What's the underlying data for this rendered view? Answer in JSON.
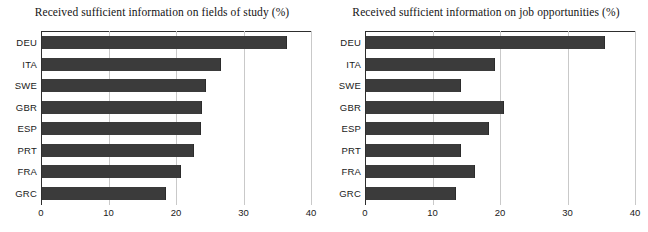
{
  "clipped_header_text": "",
  "chart_data": [
    {
      "type": "bar",
      "orientation": "horizontal",
      "title": "Received sufficient information on fields of study (%)",
      "xlabel": "",
      "ylabel": "",
      "categories": [
        "DEU",
        "ITA",
        "SWE",
        "GBR",
        "ESP",
        "PRT",
        "FRA",
        "GRC"
      ],
      "values": [
        36.2,
        26.4,
        24.2,
        23.5,
        23.4,
        22.4,
        20.4,
        18.2
      ],
      "xlim": [
        0,
        40
      ],
      "xticks": [
        0,
        10,
        20,
        30,
        40
      ],
      "xtick_labels": [
        "0",
        "10",
        "20",
        "30",
        "40"
      ],
      "grid": "vertical",
      "legend": "none",
      "bar_color": "#3b3b3b"
    },
    {
      "type": "bar",
      "orientation": "horizontal",
      "title": "Received sufficient information on job opportunities (%)",
      "xlabel": "",
      "ylabel": "",
      "categories": [
        "DEU",
        "ITA",
        "SWE",
        "GBR",
        "ESP",
        "PRT",
        "FRA",
        "GRC"
      ],
      "values": [
        35.2,
        19.0,
        13.9,
        20.3,
        18.1,
        13.9,
        16.0,
        13.2
      ],
      "xlim": [
        0,
        40
      ],
      "xticks": [
        0,
        10,
        20,
        30,
        40
      ],
      "xtick_labels": [
        "0",
        "10",
        "20",
        "30",
        "40"
      ],
      "grid": "vertical",
      "legend": "none",
      "bar_color": "#3b3b3b"
    }
  ]
}
